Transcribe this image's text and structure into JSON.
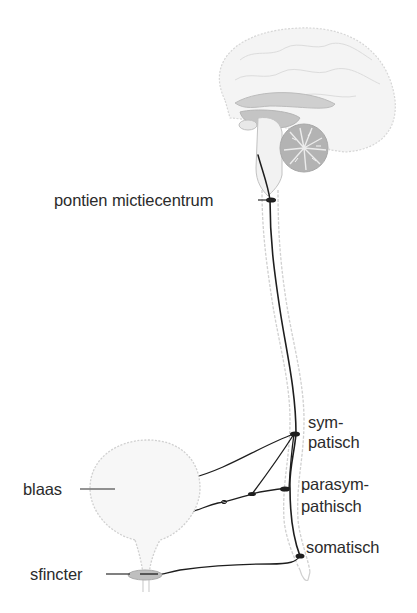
{
  "diagram": {
    "labels": {
      "pontine_center": "pontien mictiecentrum",
      "sympathetic_line1": "sym-",
      "sympathetic_line2": "patisch",
      "parasympathetic_line1": "parasym-",
      "parasympathetic_line2": "pathisch",
      "somatic": "somatisch",
      "bladder": "blaas",
      "sphincter": "sfincter"
    },
    "colors": {
      "nerve": "#1e1e1e",
      "outline": "#c8c8c8",
      "brain_fill": "#bdbdbd",
      "sphincter_fill": "#bfbfbf",
      "text": "#2b2b2b"
    }
  }
}
